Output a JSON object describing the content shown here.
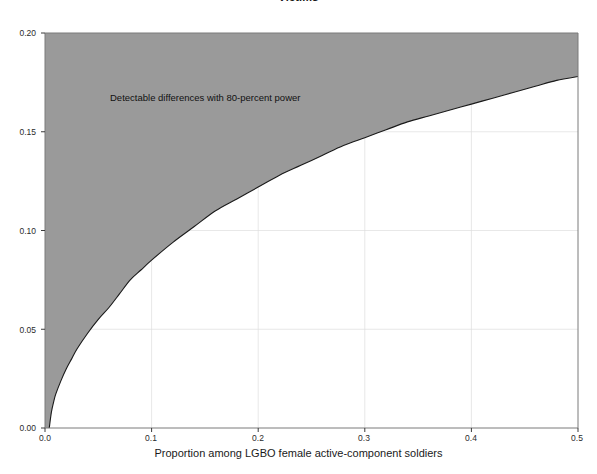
{
  "figure": {
    "title": "Victims",
    "annotation": "Detectable differences with 80-percent power",
    "background_color": "#ffffff",
    "fill_color": "#9a9a9a",
    "line_color": "#1a1a1a",
    "grid_color": "#d9d9d9"
  },
  "axes": {
    "x_title": "Proportion among LGBO female active-component soldiers",
    "y_title": "",
    "x_ticks": [
      "0.0",
      "0.1",
      "0.2",
      "0.3",
      "0.4",
      "0.5"
    ],
    "y_ticks": [
      "0.00",
      "0.05",
      "0.10",
      "0.15",
      "0.20"
    ]
  },
  "chart_data": {
    "type": "area",
    "title": "Victims",
    "xlabel": "Proportion among LGBO female active-component soldiers",
    "ylabel": "",
    "xlim": [
      0.0,
      0.5
    ],
    "ylim": [
      0.0,
      0.2
    ],
    "xticks": [
      0.0,
      0.1,
      0.2,
      0.3,
      0.4,
      0.5
    ],
    "yticks": [
      0.0,
      0.05,
      0.1,
      0.15,
      0.2
    ],
    "xticklabels": [
      "0.0",
      "0.1",
      "0.2",
      "0.3",
      "0.4",
      "0.5"
    ],
    "yticklabels": [
      "0.00",
      "0.05",
      "0.10",
      "0.15",
      "0.20"
    ],
    "grid": true,
    "legend": null,
    "fill": "above-curve",
    "fill_color": "#9a9a9a",
    "annotations": [
      {
        "text": "Detectable differences with 80-percent power",
        "x": 0.062,
        "y": 0.172
      }
    ],
    "series": [
      {
        "name": "Minimum detectable difference (80% power)",
        "x": [
          0.004,
          0.006,
          0.008,
          0.01,
          0.015,
          0.02,
          0.025,
          0.03,
          0.04,
          0.05,
          0.06,
          0.07,
          0.08,
          0.09,
          0.1,
          0.12,
          0.14,
          0.16,
          0.18,
          0.2,
          0.22,
          0.24,
          0.26,
          0.28,
          0.3,
          0.32,
          0.34,
          0.36,
          0.38,
          0.4,
          0.42,
          0.44,
          0.46,
          0.48,
          0.5
        ],
        "y": [
          0.0,
          0.008,
          0.013,
          0.017,
          0.024,
          0.03,
          0.035,
          0.04,
          0.048,
          0.055,
          0.061,
          0.068,
          0.075,
          0.08,
          0.085,
          0.094,
          0.102,
          0.11,
          0.116,
          0.122,
          0.128,
          0.133,
          0.138,
          0.143,
          0.147,
          0.151,
          0.155,
          0.158,
          0.161,
          0.164,
          0.167,
          0.17,
          0.173,
          0.176,
          0.178
        ]
      }
    ]
  }
}
